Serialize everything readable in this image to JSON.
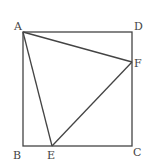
{
  "figure": {
    "type": "geometry",
    "stroke_color": "#444444",
    "background": "#ffffff",
    "points": {
      "A": {
        "label": "A",
        "x": 23,
        "y": 32
      },
      "D": {
        "label": "D",
        "x": 132,
        "y": 32
      },
      "F": {
        "label": "F",
        "x": 132,
        "y": 62
      },
      "C": {
        "label": "C",
        "x": 132,
        "y": 146
      },
      "B": {
        "label": "B",
        "x": 23,
        "y": 146
      },
      "E": {
        "label": "E",
        "x": 52,
        "y": 146
      }
    },
    "segments": [
      "AD",
      "DC",
      "CB",
      "BA",
      "AE",
      "EF",
      "FA"
    ]
  }
}
